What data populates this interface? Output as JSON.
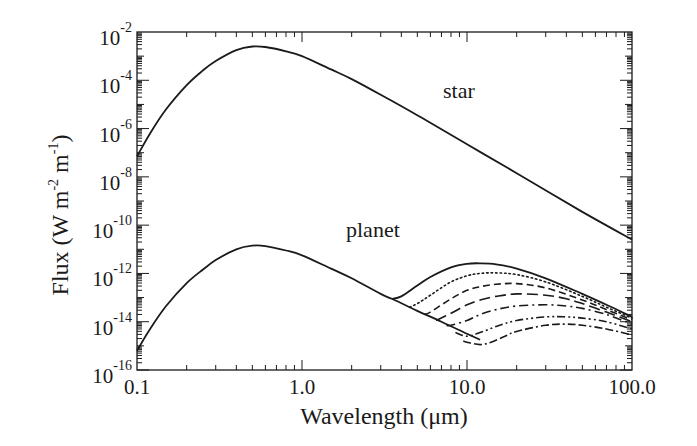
{
  "chart_data": {
    "type": "line",
    "title": "",
    "xlabel": "Wavelength (μm)",
    "ylabel": "Flux (W m^-2 m^-1)",
    "ylabel_parts": {
      "base": "Flux (W m",
      "exp1": "-2",
      "mid": " m",
      "exp2": "-1",
      "end": ")"
    },
    "xscale": "log",
    "yscale": "log",
    "xlim": [
      0.1,
      100.0
    ],
    "ylim": [
      1e-16,
      0.01
    ],
    "grid": false,
    "legend": null,
    "x_ticks": [
      {
        "value": 0.1,
        "label": "0.1"
      },
      {
        "value": 1.0,
        "label": "1.0"
      },
      {
        "value": 10.0,
        "label": "10.0"
      },
      {
        "value": 100.0,
        "label": "100.0"
      }
    ],
    "y_ticks": [
      {
        "value": -2,
        "label": "10",
        "exp": "-2"
      },
      {
        "value": -4,
        "label": "10",
        "exp": "-4"
      },
      {
        "value": -6,
        "label": "10",
        "exp": "-6"
      },
      {
        "value": -8,
        "label": "10",
        "exp": "-8"
      },
      {
        "value": -10,
        "label": "10",
        "exp": "-10"
      },
      {
        "value": -12,
        "label": "10",
        "exp": "-12"
      },
      {
        "value": -14,
        "label": "10",
        "exp": "-14"
      },
      {
        "value": -16,
        "label": "10",
        "exp": "-16"
      }
    ],
    "annotations": [
      {
        "text": "star",
        "x_um": 7.0,
        "log_flux": -5.8
      },
      {
        "text": "planet",
        "x_um": 2.2,
        "log_flux": -10.5
      }
    ],
    "series": [
      {
        "name": "star",
        "style": "solid",
        "x": [
          0.1,
          0.12,
          0.15,
          0.2,
          0.25,
          0.3,
          0.4,
          0.5,
          0.6,
          0.8,
          1.0,
          1.5,
          2,
          3,
          5,
          10,
          20,
          50,
          100
        ],
        "log_y": [
          -7.15,
          -6.2,
          -5.2,
          -4.2,
          -3.6,
          -3.2,
          -2.75,
          -2.6,
          -2.62,
          -2.8,
          -3.0,
          -3.55,
          -3.95,
          -4.6,
          -5.45,
          -6.65,
          -7.85,
          -9.45,
          -10.6
        ]
      },
      {
        "name": "planet reflected",
        "style": "solid",
        "x": [
          0.1,
          0.12,
          0.15,
          0.2,
          0.25,
          0.3,
          0.4,
          0.5,
          0.6,
          0.8,
          1.0,
          1.5,
          2,
          3,
          3.5,
          5,
          7,
          10,
          12
        ],
        "log_y": [
          -15.2,
          -14.3,
          -13.35,
          -12.4,
          -11.85,
          -11.45,
          -11.0,
          -10.85,
          -10.87,
          -11.05,
          -11.25,
          -11.8,
          -12.2,
          -12.85,
          -13.05,
          -13.55,
          -14.0,
          -14.5,
          -14.75
        ]
      },
      {
        "name": "planet thermal 1",
        "style": "solid",
        "x": [
          3.5,
          4,
          5,
          6,
          8,
          10,
          12,
          15,
          20,
          30,
          50,
          70,
          100
        ],
        "log_y": [
          -13.05,
          -12.95,
          -12.5,
          -12.15,
          -11.75,
          -11.6,
          -11.58,
          -11.62,
          -11.8,
          -12.2,
          -12.85,
          -13.3,
          -13.8
        ]
      },
      {
        "name": "planet thermal 2",
        "style": "dotted",
        "x": [
          4.5,
          5,
          6,
          8,
          10,
          12,
          15,
          20,
          30,
          50,
          70,
          100
        ],
        "log_y": [
          -13.4,
          -13.25,
          -12.9,
          -12.35,
          -12.1,
          -12.0,
          -11.98,
          -12.05,
          -12.35,
          -12.95,
          -13.4,
          -13.85
        ]
      },
      {
        "name": "planet thermal 3",
        "style": "dashed",
        "x": [
          5.5,
          6,
          8,
          10,
          12,
          15,
          20,
          30,
          50,
          70,
          100
        ],
        "log_y": [
          -13.7,
          -13.6,
          -13.05,
          -12.7,
          -12.55,
          -12.45,
          -12.42,
          -12.6,
          -13.1,
          -13.5,
          -13.92
        ]
      },
      {
        "name": "planet thermal 4",
        "style": "long-dash",
        "x": [
          6.5,
          8,
          10,
          12,
          15,
          20,
          30,
          40,
          50,
          70,
          100
        ],
        "log_y": [
          -13.95,
          -13.65,
          -13.3,
          -13.1,
          -12.95,
          -12.85,
          -12.9,
          -13.05,
          -13.25,
          -13.6,
          -14.0
        ]
      },
      {
        "name": "planet thermal 5",
        "style": "dash-dot",
        "x": [
          7.5,
          8,
          10,
          12,
          15,
          20,
          30,
          40,
          50,
          70,
          100
        ],
        "log_y": [
          -14.15,
          -14.15,
          -13.95,
          -13.7,
          -13.5,
          -13.35,
          -13.3,
          -13.35,
          -13.45,
          -13.7,
          -14.1
        ]
      },
      {
        "name": "planet thermal 6",
        "style": "dash-dot-dot",
        "x": [
          8.5,
          10,
          12,
          15,
          20,
          30,
          40,
          50,
          70,
          100
        ],
        "log_y": [
          -14.45,
          -14.6,
          -14.45,
          -14.2,
          -13.95,
          -13.8,
          -13.8,
          -13.85,
          -14.0,
          -14.3
        ]
      },
      {
        "name": "planet thermal 7",
        "style": "dash-dash-dot",
        "x": [
          9.5,
          10,
          12,
          14,
          17,
          20,
          30,
          40,
          50,
          70,
          100
        ],
        "log_y": [
          -14.8,
          -14.85,
          -14.95,
          -14.85,
          -14.6,
          -14.4,
          -14.15,
          -14.1,
          -14.15,
          -14.3,
          -14.55
        ]
      }
    ]
  }
}
